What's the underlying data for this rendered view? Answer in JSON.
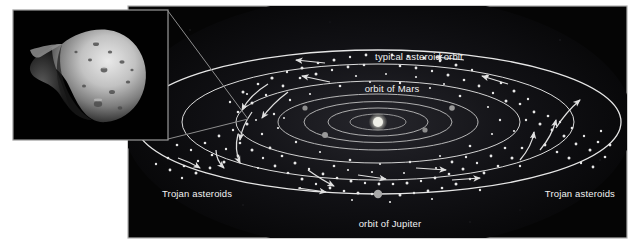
{
  "figure": {
    "kind": "astronomy-diagram",
    "page_background": "#ffffff"
  },
  "inset": {
    "name": "asteroid-photograph",
    "description": "grayscale close-up photograph of an irregular cratered asteroid",
    "frame": {
      "x": 13,
      "y": 10,
      "w": 155,
      "h": 130,
      "border_color": "#9a9a9a",
      "background": "#000000"
    }
  },
  "connector": {
    "name": "magnification-leader-lines",
    "color": "#8d8d8d",
    "lines": [
      {
        "x1": 168,
        "y1": 11,
        "x2": 248,
        "y2": 119
      },
      {
        "x1": 168,
        "y1": 139,
        "x2": 248,
        "y2": 119
      }
    ]
  },
  "panel": {
    "name": "solar-system-panel",
    "x": 128,
    "y": 6,
    "w": 499,
    "h": 232,
    "background": "#050505",
    "border_color": "#b0b0b0"
  },
  "colors": {
    "orbit_line": "#e6e6e6",
    "inner_orbit_line": "#cfcfcf",
    "asteroid_dot": "#e8e8e8",
    "arrow": "#e0e0e0",
    "sun": "#f0f0e8",
    "planet": "#9a9a9a",
    "jupiter": "#a8a8a8",
    "label_text": "#f2f2f2",
    "glow": "#1d1d22"
  },
  "labels": [
    {
      "id": "typical-asteroid-orbit",
      "text": "typical asteroid orbit",
      "x": 419,
      "y": 60,
      "anchor": "middle"
    },
    {
      "id": "orbit-of-mars",
      "text": "orbit of Mars",
      "x": 392,
      "y": 92,
      "anchor": "middle"
    },
    {
      "id": "orbit-of-jupiter",
      "text": "orbit of Jupiter",
      "x": 390,
      "y": 227,
      "anchor": "middle"
    },
    {
      "id": "trojan-asteroids-left",
      "text": "Trojan asteroids",
      "x": 162,
      "y": 197,
      "anchor": "start"
    },
    {
      "id": "trojan-asteroids-right",
      "text": "Trojan asteroids",
      "x": 615,
      "y": 197,
      "anchor": "end"
    }
  ],
  "orbits": [
    {
      "id": "jupiter-orbit",
      "cx": 378,
      "cy": 122,
      "rx": 243,
      "ry": 72,
      "stroke": "#e6e6e6",
      "width": 1.3
    },
    {
      "id": "asteroid-belt-outer",
      "cx": 378,
      "cy": 122,
      "rx": 196,
      "ry": 58,
      "stroke": "#dcdcdc",
      "width": 1.0
    },
    {
      "id": "asteroid-belt-inner",
      "cx": 378,
      "cy": 122,
      "rx": 142,
      "ry": 41,
      "stroke": "#d2d2d2",
      "width": 1.0
    },
    {
      "id": "mars-orbit",
      "cx": 378,
      "cy": 122,
      "rx": 100,
      "ry": 28,
      "stroke": "#c8c8c8",
      "width": 0.9
    },
    {
      "id": "earth-orbit",
      "cx": 378,
      "cy": 122,
      "rx": 74,
      "ry": 20.5,
      "stroke": "#c0c0c0",
      "width": 0.9
    },
    {
      "id": "venus-orbit",
      "cx": 378,
      "cy": 122,
      "rx": 50,
      "ry": 14,
      "stroke": "#bcbcbc",
      "width": 0.9
    },
    {
      "id": "mercury-orbit",
      "cx": 378,
      "cy": 122,
      "rx": 28,
      "ry": 8,
      "stroke": "#b4b4b4",
      "width": 0.8
    }
  ],
  "bodies": [
    {
      "id": "sun",
      "label": "Sun",
      "cx": 378,
      "cy": 122,
      "r": 5.0,
      "fill": "#f0f0e8"
    },
    {
      "id": "planet-mars",
      "label": "Mars",
      "cx": 325,
      "cy": 135,
      "r": 3.0,
      "fill": "#9a9a9a"
    },
    {
      "id": "planet-inner-right",
      "label": "planet",
      "cx": 425,
      "cy": 130,
      "r": 2.6,
      "fill": "#8e8e8e"
    },
    {
      "id": "planet-outer-left",
      "label": "planet",
      "cx": 305,
      "cy": 108,
      "r": 2.6,
      "fill": "#8e8e8e"
    },
    {
      "id": "planet-outer-right",
      "label": "planet",
      "cx": 452,
      "cy": 108,
      "r": 2.8,
      "fill": "#9a9a9a"
    },
    {
      "id": "jupiter",
      "label": "Jupiter",
      "cx": 378,
      "cy": 194,
      "r": 4.2,
      "fill": "#a8a8a8"
    }
  ],
  "asteroid_belt": {
    "description": "dense scatter of small bright dots forming a torus between the inner and outer belt ellipses",
    "dot_count": 168,
    "dot_radius_range": [
      0.8,
      2.1
    ]
  },
  "motion_arrows": {
    "description": "curved white arrows showing counter-clockwise orbital motion of belt asteroids",
    "count": 18,
    "color": "#e0e0e0"
  }
}
